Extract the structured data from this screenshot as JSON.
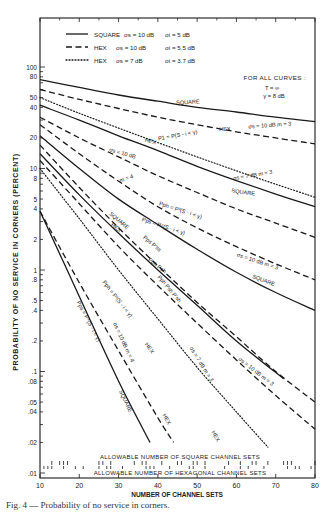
{
  "chart_data": {
    "type": "line",
    "title": "",
    "xlabel": "NUMBER OF CHANNEL SETS",
    "ylabel": "PROBABILITY OF NO SERVICE IN CORNERS (PERCENT)",
    "xlim": [
      10,
      80
    ],
    "ylim": [
      0.01,
      100
    ],
    "yscale": "log",
    "grid": false,
    "x_ticks": [
      "10",
      "20",
      "30",
      "40",
      "50",
      "60",
      "70",
      "80"
    ],
    "y_ticks": [
      "100",
      "80",
      "50",
      "40",
      "20",
      "10",
      "8",
      "5",
      "4",
      "2",
      "1",
      ".8",
      ".5",
      ".4",
      ".2",
      ".1",
      ".08",
      ".05",
      ".04",
      ".02",
      ".01"
    ],
    "legend": [
      {
        "style": "solid",
        "label": "SQUARE",
        "sigma_s": "σs = 10 dB",
        "sigma_i": "σi = 5 dB"
      },
      {
        "style": "dashed",
        "label": "HEX",
        "sigma_s": "σs = 10 dB",
        "sigma_i": "σi = 5.5 dB"
      },
      {
        "style": "dotted",
        "label": "HEX",
        "sigma_s": "σs = 7 dB",
        "sigma_i": "σi = 3.7 dB"
      }
    ],
    "legend_position": "top-left",
    "note": {
      "title": "FOR ALL CURVES :",
      "line1": "T = ∞",
      "line2": "γ = 8 dB"
    },
    "series": [
      {
        "name": "P1 SQUARE σs=10dB m=3",
        "style": "solid",
        "x": [
          10,
          20,
          30,
          40,
          50,
          60,
          70,
          80
        ],
        "y": [
          75,
          63,
          53,
          46,
          40,
          36,
          32,
          29
        ]
      },
      {
        "name": "P1 HEX σs=10dB m=3",
        "style": "dashed",
        "x": [
          10,
          20,
          30,
          40,
          50,
          60,
          70,
          80
        ],
        "y": [
          60,
          48,
          39,
          32,
          27,
          23,
          20,
          17.5
        ]
      },
      {
        "name": "P1 HEX σs=7dB m=3",
        "style": "dotted",
        "x": [
          10,
          20,
          30,
          40,
          50,
          60,
          70,
          80
        ],
        "y": [
          50,
          35,
          25,
          18,
          13,
          9.5,
          7,
          5.2
        ]
      },
      {
        "name": "P1 SQUARE σs=7dB m=3",
        "style": "solid",
        "x": [
          10,
          20,
          30,
          40,
          50,
          60,
          70,
          80
        ],
        "y": [
          42,
          30,
          21,
          15,
          10.5,
          7.6,
          5.6,
          4.2
        ]
      },
      {
        "name": "P1 HEX σs=10dB m=4",
        "style": "dashed",
        "x": [
          10,
          20,
          30,
          40,
          50,
          60,
          70,
          80
        ],
        "y": [
          32,
          20,
          13,
          8.5,
          5.8,
          4,
          2.9,
          2.1
        ]
      },
      {
        "name": "Pph HEX σs=10dB m=3",
        "style": "dashed",
        "x": [
          10,
          20,
          30,
          40,
          50,
          60,
          70,
          80
        ],
        "y": [
          27,
          14,
          7.5,
          4.2,
          2.6,
          1.7,
          1.15,
          0.8
        ]
      },
      {
        "name": "Pps SQUARE σs=10dB m=3",
        "style": "solid",
        "x": [
          10,
          20,
          30,
          40,
          50,
          60,
          70,
          80
        ],
        "y": [
          21,
          10,
          5,
          2.8,
          1.6,
          0.95,
          0.6,
          0.4
        ]
      },
      {
        "name": "Pps P'ss SQUARE",
        "style": "solid",
        "x": [
          10,
          20,
          30,
          40,
          50,
          60,
          72
        ],
        "y": [
          14,
          5.5,
          2.3,
          1.0,
          0.45,
          0.2,
          0.085
        ]
      },
      {
        "name": "Pph Psh HEX",
        "style": "dashed",
        "x": [
          10,
          20,
          30,
          40,
          50,
          60,
          70,
          80
        ],
        "y": [
          17,
          6.5,
          2.6,
          1.1,
          0.48,
          0.22,
          0.1,
          0.05
        ]
      },
      {
        "name": "Pph P'sh HEX σs=10dB m=3",
        "style": "dashed",
        "x": [
          10,
          20,
          30,
          40,
          50,
          60,
          70,
          80
        ],
        "y": [
          12,
          4.5,
          1.7,
          0.7,
          0.3,
          0.13,
          0.058,
          0.027
        ]
      },
      {
        "name": "Pph HEX σs=7dB m=3",
        "style": "dotted",
        "x": [
          10,
          20,
          30,
          40,
          50,
          60,
          68
        ],
        "y": [
          10,
          3.2,
          1.0,
          0.33,
          0.11,
          0.04,
          0.018
        ]
      },
      {
        "name": "Pph=P^3(S-i<γ) HEX",
        "style": "dashed",
        "x": [
          10,
          20,
          30,
          40,
          44
        ],
        "y": [
          3.8,
          0.75,
          0.16,
          0.035,
          0.02
        ]
      },
      {
        "name": "Pps=P^4(S-i<γ) SQUARE",
        "style": "solid",
        "x": [
          10,
          20,
          30,
          38
        ],
        "y": [
          3.8,
          0.55,
          0.08,
          0.02
        ]
      }
    ],
    "annotations": [
      "SQUARE",
      "HEX",
      "σs = 10 dB  m = 3",
      "P1 = P(S - i < γ)",
      "HEX",
      "σs = 10 dB",
      "m = 4",
      "σs = 7 dB  m = 3",
      "SQUARE",
      "SQUARE",
      "HEX",
      "Pph = P³(S - i < γ)",
      "Pps = P⁴(S - i < γ)",
      "Pps P'ss",
      "Pph Psh",
      "Pph Psh P'sh",
      "σs = 10 dB  m = 3",
      "SQUARE",
      "Pph = P³(S - i < γ)",
      "HEX",
      "σs = 10 dB  m = 3",
      "σs = 7 dB  m = 3",
      "HEX",
      "Pps = P⁴(S - i < γ)",
      "σs = 10 dB  m = 4",
      "SQUARE",
      "HEX"
    ],
    "allowable_rows": {
      "square_label": "ALLOWABLE NUMBER OF SQUARE CHANNEL SETS",
      "hex_label": "ALLOWABLE NUMBER OF HEXAGONAL CHANNEL SETS",
      "square_x": [
        13,
        15,
        16,
        17,
        25,
        26,
        28,
        34,
        36,
        37,
        41,
        45,
        46,
        49,
        50,
        52,
        58,
        61,
        64,
        65,
        68,
        72,
        73,
        74,
        80
      ],
      "hex_x": [
        11,
        12,
        13,
        16,
        19,
        21,
        25,
        27,
        28,
        31,
        37,
        38,
        39,
        43,
        48,
        49,
        52,
        57,
        61,
        63,
        67,
        73,
        75,
        76,
        79
      ]
    }
  },
  "caption": "Fig. 4 — Probability of no service in corners."
}
